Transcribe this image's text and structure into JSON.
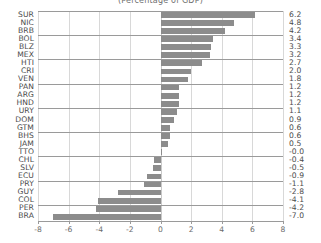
{
  "chart": {
    "title": "(Percentage of GDP)"
  },
  "chart_data": {
    "type": "bar",
    "orientation": "horizontal",
    "title": "(Percentage of GDP)",
    "xlabel": "",
    "ylabel": "",
    "xlim": [
      -8,
      8
    ],
    "xticks": [
      -8,
      -6,
      -4,
      -2,
      0,
      2,
      4,
      6,
      8
    ],
    "xticklabels": [
      "-8",
      "-6",
      "-4",
      "-2",
      "0",
      "2",
      "4",
      "6",
      "8"
    ],
    "grid": true,
    "legend": false,
    "bar_color": "#8c8c8c",
    "categories": [
      "SUR",
      "NIC",
      "BRB",
      "BOL",
      "BLZ",
      "MEX",
      "HTI",
      "CRI",
      "VEN",
      "PAN",
      "ARG",
      "HND",
      "URY",
      "DOM",
      "GTM",
      "BHS",
      "JAM",
      "TTO",
      "CHL",
      "SLV",
      "ECU",
      "PRY",
      "GUY",
      "COL",
      "PER",
      "BRA"
    ],
    "values": [
      6.2,
      4.8,
      4.2,
      3.4,
      3.3,
      3.2,
      2.7,
      2.0,
      1.8,
      1.2,
      1.2,
      1.2,
      1.1,
      0.9,
      0.6,
      0.6,
      0.5,
      -0.0,
      -0.4,
      -0.5,
      -0.9,
      -1.1,
      -2.8,
      -4.1,
      -4.2,
      -7.0
    ],
    "value_labels": [
      "6.2",
      "4.8",
      "4.2",
      "3.4",
      "3.3",
      "3.2",
      "2.7",
      "2.0",
      "1.8",
      "1.2",
      "1.2",
      "1.2",
      "1.1",
      "0.9",
      "0.6",
      "0.6",
      "0.5",
      "-0.0",
      "-0.4",
      "-0.5",
      "-0.9",
      "-1.1",
      "-2.8",
      "-4.1",
      "-4.2",
      "-7.0"
    ]
  }
}
